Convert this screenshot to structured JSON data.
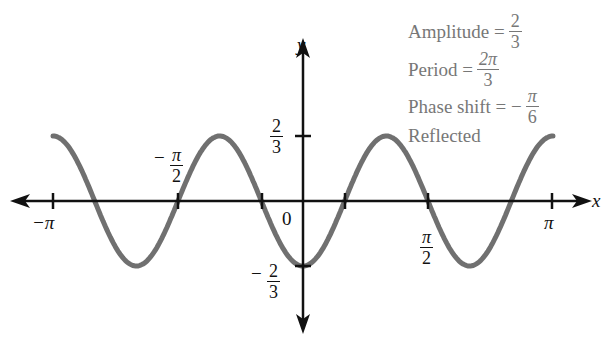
{
  "chart_data": {
    "type": "line",
    "title": "",
    "function": "y = -(2/3) cos(3x)",
    "xlabel": "x",
    "ylabel": "y",
    "xlim": [
      -3.14159,
      3.14159
    ],
    "ylim": [
      -0.6667,
      0.6667
    ],
    "x_ticks": [
      {
        "value": -3.14159,
        "label": "−π"
      },
      {
        "value": -1.5708,
        "label": "−π/2"
      },
      {
        "value": -0.5236,
        "label": ""
      },
      {
        "value": 0.5236,
        "label": ""
      },
      {
        "value": 1.5708,
        "label": "π/2"
      },
      {
        "value": 3.14159,
        "label": "π"
      }
    ],
    "y_ticks": [
      {
        "value": 0.6667,
        "label": "2/3"
      },
      {
        "value": -0.6667,
        "label": "−2/3"
      }
    ],
    "origin_label": "0",
    "series": [
      {
        "name": "y = -(2/3)cos(3x)",
        "color": "#707070",
        "x": [
          -3.14159,
          -2.618,
          -2.0944,
          -1.5708,
          -1.0472,
          -0.5236,
          0,
          0.5236,
          1.0472,
          1.5708,
          2.0944,
          2.618,
          3.14159
        ],
        "y": [
          0.6667,
          0,
          -0.6667,
          0,
          0.6667,
          0,
          -0.6667,
          0,
          0.6667,
          0,
          -0.6667,
          0,
          0.6667
        ]
      }
    ],
    "annotations": [
      "Amplitude = 2/3",
      "Period = 2π/3",
      "Phase shift = −π/6",
      "Reflected"
    ],
    "grid": false,
    "legend": "none"
  },
  "axes": {
    "x_label": "x",
    "y_label": "y",
    "origin": "0"
  },
  "ticks": {
    "neg_pi": "−π",
    "pi": "π",
    "pi_sym": "π",
    "two": "2",
    "three": "3",
    "minus": "−"
  },
  "annotations": {
    "amplitude_label": "Amplitude =",
    "amplitude_num": "2",
    "amplitude_den": "3",
    "period_label": "Period =",
    "period_num": "2π",
    "period_den": "3",
    "phase_label": "Phase shift = −",
    "phase_num": "π",
    "phase_den": "6",
    "reflected": "Reflected"
  }
}
